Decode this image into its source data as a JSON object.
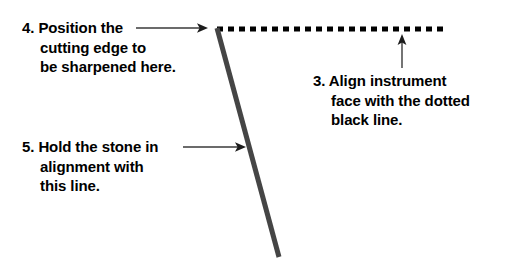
{
  "figure": {
    "background_color": "#ffffff",
    "width": 507,
    "height": 267
  },
  "callouts": [
    {
      "id": "callout-3",
      "number": "3.",
      "lines": [
        "3. Align instrument",
        "face with the dotted",
        "black line."
      ],
      "full_text": "3. Align instrument face with the dotted black line.",
      "color": "#000000"
    },
    {
      "id": "callout-4",
      "number": "4.",
      "lines": [
        "4. Position the",
        "cutting edge to",
        "be sharpened here."
      ],
      "full_text": "4. Position the cutting edge to be sharpened here.",
      "color": "#000000"
    },
    {
      "id": "callout-5",
      "number": "5.",
      "lines": [
        "5. Hold the stone in",
        "alignment with",
        "this line."
      ],
      "full_text": "5. Hold the stone in alignment with this line.",
      "color": "#000000"
    }
  ],
  "graphics": {
    "dotted_line": {
      "label": "dotted black line",
      "color": "#000000",
      "x_start": 217,
      "x_end": 447,
      "y": 29,
      "thickness": 5,
      "dash_length": 6,
      "gap_length": 5
    },
    "diagonal_line": {
      "label": "stone alignment line",
      "color": "#454545",
      "x_start": 217,
      "y_start": 28,
      "x_end": 279,
      "y_end": 257,
      "thickness": 5
    },
    "arrows": [
      {
        "id": "arrow-callout-4",
        "direction": "right",
        "color": "#3a3a3a",
        "x_start": 136,
        "y_start": 28,
        "x_end": 208,
        "y_end": 28
      },
      {
        "id": "arrow-callout-5",
        "direction": "right",
        "color": "#3a3a3a",
        "x_start": 183,
        "y_start": 147,
        "x_end": 246,
        "y_end": 147
      },
      {
        "id": "arrow-callout-3",
        "direction": "up",
        "color": "#3a3a3a",
        "x_start": 402,
        "y_start": 68,
        "x_end": 402,
        "y_end": 34
      }
    ]
  }
}
